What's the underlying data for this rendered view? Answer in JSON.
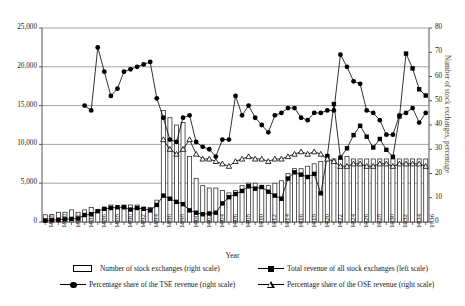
{
  "chart_data": {
    "type": "bar",
    "title": "",
    "xlabel": "Year",
    "ylabel": "",
    "ylabel_right": "Number of stock exchanges, percentage",
    "ylim": [
      0,
      25000
    ],
    "ylim_right": [
      0,
      80
    ],
    "yticks": [
      "0",
      "5,000",
      "10,000",
      "15,000",
      "20,000",
      "25,000"
    ],
    "yticks_right": [
      "0",
      "10",
      "20",
      "30",
      "40",
      "50",
      "60",
      "70",
      "80"
    ],
    "grid": true,
    "legend_position": "bottom",
    "x": [
      1878,
      1879,
      1880,
      1881,
      1882,
      1883,
      1884,
      1885,
      1886,
      1887,
      1888,
      1889,
      1890,
      1891,
      1892,
      1893,
      1894,
      1895,
      1896,
      1897,
      1898,
      1899,
      1900,
      1901,
      1902,
      1903,
      1904,
      1905,
      1906,
      1907,
      1908,
      1909,
      1910,
      1911,
      1912,
      1913,
      1914,
      1915,
      1916,
      1917,
      1918,
      1919,
      1920,
      1921,
      1922,
      1923,
      1924,
      1925,
      1926,
      1927,
      1928,
      1929,
      1930,
      1931,
      1932,
      1933,
      1934,
      1935,
      1936
    ],
    "xtick_labels": [
      "1878",
      "1880",
      "1882",
      "1884",
      "1886",
      "1888",
      "1890",
      "1892",
      "1894",
      "1896",
      "1898",
      "1900",
      "1902",
      "1904",
      "1906",
      "1908",
      "1910",
      "1912",
      "1914",
      "1916",
      "1918",
      "1920",
      "1922",
      "1924",
      "1926",
      "1928",
      "1930",
      "1932",
      "1934",
      "1936"
    ],
    "series": [
      {
        "name": "Number of stock exchanges (right scale)",
        "type": "bar",
        "scale": "right",
        "marker": "open-rect",
        "values": [
          3,
          3,
          4,
          4,
          5,
          4,
          5,
          6,
          5,
          6,
          7,
          6,
          7,
          7,
          7,
          6,
          6,
          9,
          46,
          43,
          40,
          41,
          27,
          18,
          15,
          14,
          14,
          13,
          12,
          13,
          15,
          16,
          16,
          15,
          15,
          16,
          17,
          20,
          22,
          22,
          23,
          24,
          25,
          26,
          26,
          26,
          27,
          26,
          26,
          26,
          26,
          26,
          26,
          26,
          26,
          26,
          26,
          26,
          26
        ]
      },
      {
        "name": "Total revenue of all stock exchanges (left scale)",
        "type": "line",
        "scale": "left",
        "marker": "filled-square",
        "values": [
          200,
          250,
          300,
          350,
          400,
          450,
          900,
          1000,
          1400,
          1700,
          1800,
          1900,
          1900,
          1600,
          1800,
          1700,
          1500,
          2200,
          3400,
          3000,
          2600,
          2300,
          1500,
          1200,
          1000,
          1100,
          1200,
          2400,
          3200,
          3600,
          4000,
          4600,
          4300,
          4500,
          3900,
          3400,
          3000,
          5600,
          6400,
          6100,
          5800,
          6200,
          3700,
          8500,
          15200,
          8300,
          9500,
          11200,
          12400,
          11000,
          9600,
          10700,
          9300,
          8400,
          13600,
          21700,
          19800,
          17100,
          16300
        ]
      },
      {
        "name": "Percentage share of the TSE revenue (right scale)",
        "type": "line",
        "scale": "right",
        "marker": "filled-circle",
        "values": [
          null,
          null,
          null,
          null,
          null,
          null,
          48,
          46,
          72,
          62,
          52,
          55,
          62,
          63,
          64,
          65,
          66,
          51,
          43,
          34,
          33,
          43,
          44,
          33,
          31,
          30,
          27,
          34,
          34,
          52,
          44,
          48,
          43,
          40,
          37,
          44,
          45,
          47,
          47,
          43,
          42,
          45,
          45,
          46,
          46,
          69,
          64,
          58,
          57,
          46,
          45,
          42,
          36,
          36,
          44,
          45,
          47,
          41,
          45
        ]
      },
      {
        "name": "Percentage share of the OSE revenue (right scale)",
        "type": "line",
        "scale": "right",
        "marker": "open-triangle",
        "values": [
          null,
          null,
          null,
          null,
          null,
          null,
          null,
          null,
          null,
          null,
          null,
          null,
          null,
          null,
          null,
          null,
          null,
          null,
          34,
          30,
          28,
          30,
          34,
          28,
          26,
          26,
          25,
          24,
          23,
          25,
          26,
          27,
          26,
          26,
          25,
          26,
          26,
          27,
          28,
          29,
          28,
          29,
          28,
          26,
          25,
          23,
          23,
          24,
          24,
          23,
          23,
          24,
          24,
          23,
          24,
          24,
          24,
          24,
          23
        ]
      }
    ]
  }
}
